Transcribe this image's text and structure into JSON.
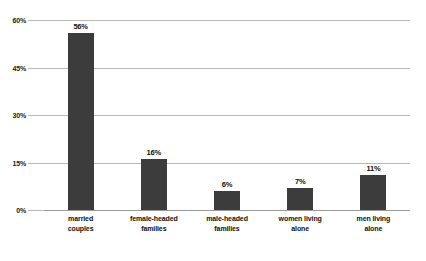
{
  "chart_data": {
    "type": "bar",
    "title": "",
    "subtitle": "",
    "xlabel": "",
    "ylabel": "",
    "categories": [
      "married couples",
      "female-headed families",
      "male-headed families",
      "women living alone",
      "men living alone"
    ],
    "category_lines": [
      [
        "married",
        "couples"
      ],
      [
        "female-headed",
        "families"
      ],
      [
        "male-headed",
        "families"
      ],
      [
        "women living",
        "alone"
      ],
      [
        "men living",
        "alone"
      ]
    ],
    "values": [
      56,
      16,
      6,
      7,
      11
    ],
    "value_labels": [
      "56%",
      "16%",
      "6%",
      "7%",
      "11%"
    ],
    "ylim": [
      0,
      60
    ],
    "yticks": [
      60,
      45,
      30,
      15,
      0
    ],
    "ytick_labels": [
      "60%",
      "45%",
      "30%",
      "15%",
      "0%"
    ],
    "grid": true,
    "legend": false,
    "legend_position": "none",
    "colors": {
      "bar": "#3c3c3c",
      "gridline": "#b9b9b9",
      "baseline": "#9a9a9a",
      "text": "#111111",
      "background": "#ffffff"
    }
  }
}
